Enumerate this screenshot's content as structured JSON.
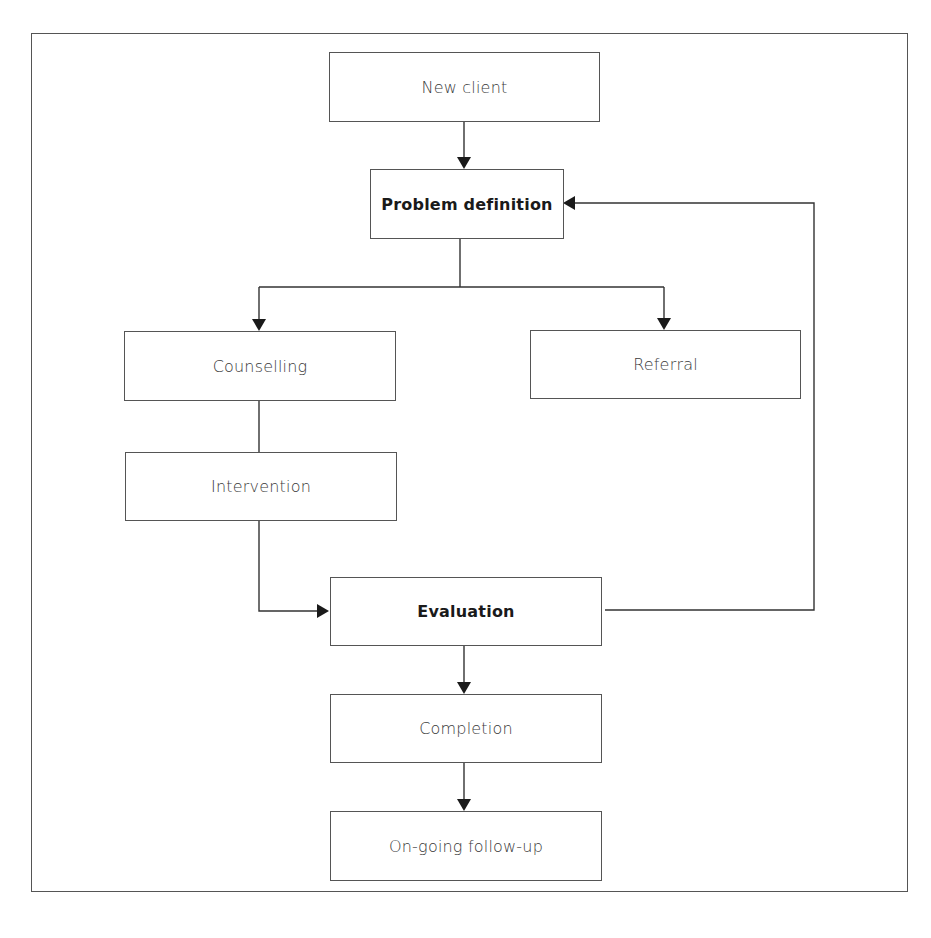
{
  "diagram": {
    "type": "flowchart",
    "nodes": {
      "new_client": {
        "label": "New client",
        "emphasis": "normal"
      },
      "problem_definition": {
        "label": "Problem definition",
        "emphasis": "bold"
      },
      "counselling": {
        "label": "Counselling",
        "emphasis": "normal"
      },
      "referral": {
        "label": "Referral",
        "emphasis": "normal"
      },
      "intervention": {
        "label": "Intervention",
        "emphasis": "normal"
      },
      "evaluation": {
        "label": "Evaluation",
        "emphasis": "bold"
      },
      "completion": {
        "label": "Completion",
        "emphasis": "normal"
      },
      "ongoing_follow_up": {
        "label": "On-going follow-up",
        "emphasis": "normal"
      }
    },
    "edges": [
      {
        "from": "New client",
        "to": "Problem definition",
        "arrow": true
      },
      {
        "from": "Problem definition",
        "to": "Counselling",
        "arrow": true
      },
      {
        "from": "Problem definition",
        "to": "Referral",
        "arrow": true
      },
      {
        "from": "Counselling",
        "to": "Intervention",
        "arrow": false
      },
      {
        "from": "Intervention",
        "to": "Evaluation",
        "arrow": true
      },
      {
        "from": "Evaluation",
        "to": "Problem definition",
        "arrow": true,
        "route": "feedback loop via right side"
      },
      {
        "from": "Evaluation",
        "to": "Completion",
        "arrow": true
      },
      {
        "from": "Completion",
        "to": "On-going follow-up",
        "arrow": true
      }
    ],
    "colors": {
      "line": "#333333",
      "border": "#555555",
      "text": "#3a3a3a",
      "background": "#ffffff"
    }
  }
}
